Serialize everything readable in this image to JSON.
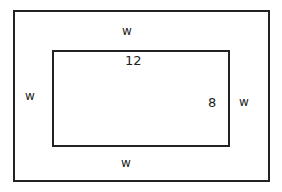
{
  "diagram": {
    "outer_rect": {
      "labels": {
        "top": "w",
        "left": "w",
        "right": "w",
        "bottom": "w"
      }
    },
    "inner_rect": {
      "length_label": "12",
      "width_label": "8"
    }
  }
}
